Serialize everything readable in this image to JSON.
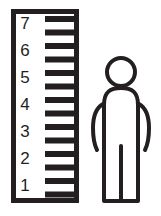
{
  "illustration": {
    "title": "Height measuring ruler with standing person",
    "background_color": "#ffffff",
    "ink_color": "#231f20"
  },
  "ruler": {
    "label": "measuring-ruler",
    "frame": {
      "x": 11,
      "y": 9,
      "width": 68,
      "height": 194,
      "stroke_width": 5
    },
    "numbers": [
      "7",
      "6",
      "5",
      "4",
      "3",
      "2",
      "1"
    ],
    "number_positions_y": [
      24,
      50,
      77,
      104,
      131,
      158,
      185
    ],
    "number_x": 24,
    "ticks": {
      "count": 14,
      "x_start": 45,
      "x_end": 76,
      "thickness": 6,
      "positions_y": [
        19,
        33,
        46,
        60,
        73,
        87,
        100,
        114,
        127,
        141,
        154,
        168,
        181,
        194
      ]
    }
  },
  "person": {
    "label": "standing-person-figure",
    "stroke_width": 4,
    "head": {
      "cx": 121,
      "cy": 72,
      "r": 14
    },
    "parts": [
      "head",
      "torso",
      "left-arm",
      "right-arm",
      "left-leg",
      "right-leg"
    ]
  }
}
